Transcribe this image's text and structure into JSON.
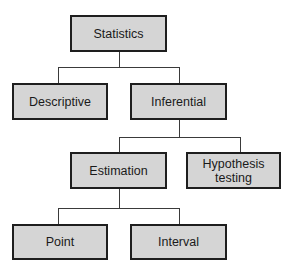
{
  "diagram": {
    "type": "tree",
    "colors": {
      "node_fill": "#d5d5d5",
      "node_border": "#1e1e1e",
      "connector": "#3a3a3a",
      "background": "#ffffff"
    },
    "nodes": {
      "statistics": {
        "label": "Statistics"
      },
      "descriptive": {
        "label": "Descriptive",
        "parent": "Statistics"
      },
      "inferential": {
        "label": "Inferential",
        "parent": "Statistics"
      },
      "estimation": {
        "label": "Estimation",
        "parent": "Inferential"
      },
      "hypothesis_testing": {
        "label_line1": "Hypothesis",
        "label_line2": "testing",
        "parent": "Inferential"
      },
      "point": {
        "label": "Point",
        "parent": "Estimation"
      },
      "interval": {
        "label": "Interval",
        "parent": "Estimation"
      }
    }
  }
}
